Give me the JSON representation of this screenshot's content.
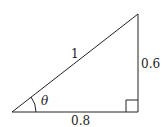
{
  "diagram": {
    "type": "right-triangle",
    "vertices": {
      "angle_vertex": [
        12,
        112
      ],
      "top_vertex": [
        138,
        14
      ],
      "right_angle_vertex": [
        138,
        112
      ]
    },
    "labels": {
      "hypotenuse": "1",
      "opposite": "0.6",
      "adjacent": "0.8",
      "angle": "θ"
    },
    "right_angle_marker": true,
    "stroke_color": "#222222",
    "background": "#ffffff"
  }
}
